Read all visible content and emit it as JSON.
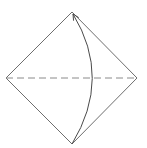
{
  "diagram": {
    "type": "origami-fold-step",
    "colors": {
      "background": "#ffffff",
      "outline": "#6e6e6e",
      "fold_line": "#8a8a8a",
      "arrow": "#4a4a4a"
    },
    "shape": {
      "name": "diamond",
      "points": {
        "top": [
          72,
          12
        ],
        "right": [
          137,
          78
        ],
        "bottom": [
          72,
          144
        ],
        "left": [
          6,
          78
        ]
      }
    },
    "fold_line": {
      "style": "dashed",
      "from": [
        6,
        78
      ],
      "to": [
        137,
        78
      ],
      "dash": "7 4"
    },
    "arrow": {
      "description": "curved fold arrow from bottom corner to top corner",
      "start": [
        72,
        144
      ],
      "control": [
        112,
        78
      ],
      "end": [
        73,
        14
      ]
    }
  }
}
